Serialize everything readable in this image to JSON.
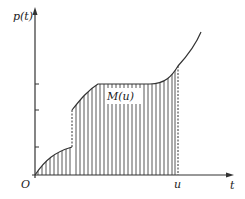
{
  "diagram": {
    "y_axis_label": "p(t)",
    "x_axis_label": "t",
    "origin_label": "O",
    "upper_limit_label": "u",
    "area_label": "M(u)",
    "colors": {
      "stroke": "#333333",
      "hatch": "#444444",
      "background": "#ffffff"
    }
  }
}
